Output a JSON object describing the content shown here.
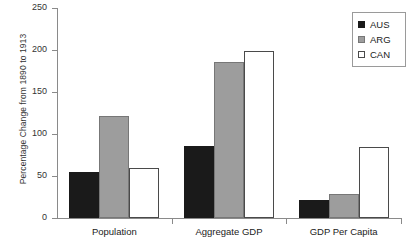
{
  "chart_data": {
    "type": "bar",
    "title": "",
    "xlabel": "",
    "ylabel": "Percentage Change from 1890 to 1913",
    "ylim": [
      0,
      250
    ],
    "yticks": [
      0,
      50,
      100,
      150,
      200,
      250
    ],
    "grid": false,
    "legend_position": "top-right",
    "categories": [
      "Population",
      "Aggregate GDP",
      "GDP Per Capita"
    ],
    "series": [
      {
        "name": "AUS",
        "color": "#1a1a1a",
        "values": [
          55,
          86,
          21
        ]
      },
      {
        "name": "ARG",
        "color": "#9d9d9d",
        "values": [
          121,
          186,
          29
        ]
      },
      {
        "name": "CAN",
        "color": "#ffffff",
        "values": [
          59,
          199,
          85
        ]
      }
    ]
  },
  "axis": {
    "tick_labels": [
      "250",
      "200",
      "150",
      "100",
      "50",
      "0"
    ]
  },
  "legend": {
    "items": [
      {
        "label": "AUS",
        "swatch": "legend-swatch-aus"
      },
      {
        "label": "ARG",
        "swatch": "legend-swatch-arg"
      },
      {
        "label": "CAN",
        "swatch": "legend-swatch-can"
      }
    ]
  }
}
